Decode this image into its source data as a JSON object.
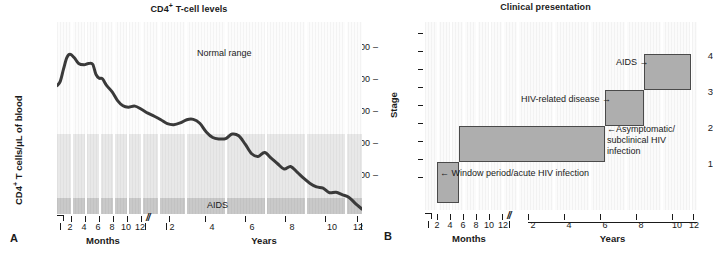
{
  "figure": {
    "panel_a_letter": "A",
    "panel_b_letter": "B"
  },
  "panelA": {
    "title": "CD4+ T-cell levels",
    "title_main": "CD4",
    "title_sup": "+",
    "title_rest": " T-cell levels",
    "ylabel_main": "CD4",
    "ylabel_sup": "+",
    "ylabel_rest": " T cells/μL of blood",
    "yticks": [
      "1000",
      "800",
      "600",
      "400",
      "200"
    ],
    "band_labels": {
      "normal": "Normal range",
      "aids": "AIDS"
    },
    "axis_months_name": "Months",
    "axis_years_name": "Years",
    "months_ticks": [
      "2",
      "4",
      "6",
      "8",
      "10",
      "12"
    ],
    "years_ticks": [
      "2",
      "4",
      "6",
      "8",
      "10",
      "12"
    ],
    "break_mark": "//"
  },
  "panelB": {
    "title": "Clinical presentation",
    "ylabel": "Stage",
    "yticks": [
      "4",
      "3",
      "2",
      "1"
    ],
    "axis_months_name": "Months",
    "axis_years_name": "Years",
    "months_ticks": [
      "2",
      "4",
      "6",
      "8",
      "10",
      "12"
    ],
    "years_ticks": [
      "2",
      "4",
      "6",
      "8",
      "10",
      "12"
    ],
    "break_mark": "//",
    "annotations": {
      "window_period": "← Window period/acute HIV infection",
      "hiv_related": "HIV-related disease →",
      "asymptomatic": "←Asymptomatic/ subclinical HIV infection",
      "aids": "AIDS →"
    }
  },
  "chart_data": [
    {
      "type": "line",
      "title": "CD4+ T-cell levels",
      "xlabel": "Months / Years",
      "ylabel": "CD4+ T cells/μL of blood",
      "ylim": [
        0,
        1100
      ],
      "yticks": [
        200,
        400,
        600,
        800,
        1000
      ],
      "grid": true,
      "x_axis_segments": [
        {
          "name": "Months",
          "ticks": [
            2,
            4,
            6,
            8,
            10,
            12
          ]
        },
        {
          "name": "Years",
          "ticks": [
            2,
            4,
            6,
            8,
            10,
            12
          ]
        }
      ],
      "bands": [
        {
          "label": "Normal range",
          "from": 600,
          "to": 1100,
          "color": "#fcfcfc"
        },
        {
          "label": "",
          "from": 200,
          "to": 600,
          "color": "#e8e8e8"
        },
        {
          "label": "AIDS",
          "from": 0,
          "to": 200,
          "color": "#c9c9c9"
        }
      ],
      "series": [
        {
          "name": "CD4+ T cells",
          "color": "#3a3a3a",
          "points": [
            [
              0.0,
              735
            ],
            [
              1.5,
              760
            ],
            [
              3.0,
              830
            ],
            [
              4.5,
              895
            ],
            [
              6.0,
              915
            ],
            [
              8.0,
              895
            ],
            [
              10.0,
              862
            ],
            [
              12.5,
              855
            ],
            [
              14.5,
              862
            ],
            [
              16.5,
              858
            ],
            [
              18.0,
              800
            ],
            [
              19.5,
              778
            ],
            [
              21.0,
              775
            ],
            [
              23.0,
              735
            ],
            [
              25.5,
              700
            ],
            [
              28.0,
              650
            ],
            [
              30.5,
              620
            ],
            [
              33.0,
              612
            ],
            [
              36.0,
              618
            ],
            [
              39.0,
              600
            ],
            [
              42.0,
              578
            ],
            [
              45.0,
              560
            ],
            [
              48.0,
              540
            ],
            [
              51.0,
              518
            ],
            [
              54.0,
              512
            ],
            [
              57.0,
              522
            ],
            [
              60.0,
              540
            ],
            [
              63.0,
              542
            ],
            [
              66.0,
              520
            ],
            [
              69.0,
              470
            ],
            [
              72.0,
              438
            ],
            [
              75.0,
              430
            ],
            [
              78.0,
              432
            ],
            [
              81.0,
              458
            ],
            [
              84.0,
              448
            ],
            [
              87.0,
              400
            ],
            [
              90.0,
              345
            ],
            [
              93.0,
              330
            ],
            [
              96.0,
              352
            ],
            [
              99.0,
              320
            ],
            [
              102.0,
              288
            ],
            [
              105.0,
              258
            ],
            [
              108.0,
              272
            ],
            [
              111.0,
              240
            ],
            [
              114.0,
              205
            ],
            [
              117.0,
              175
            ],
            [
              120.0,
              155
            ],
            [
              123.0,
              148
            ],
            [
              126.0,
              122
            ],
            [
              129.0,
              125
            ],
            [
              132.0,
              110
            ],
            [
              135.0,
              95
            ],
            [
              138.0,
              60
            ],
            [
              141.0,
              28
            ]
          ]
        }
      ]
    },
    {
      "type": "bar",
      "orientation": "horizontal-steps",
      "title": "Clinical presentation",
      "xlabel": "Months / Years",
      "ylabel": "Stage",
      "ylim": [
        0.5,
        4.7
      ],
      "yticks": [
        1,
        2,
        3,
        4
      ],
      "grid": true,
      "x_axis_segments": [
        {
          "name": "Months",
          "ticks": [
            2,
            4,
            6,
            8,
            10,
            12
          ]
        },
        {
          "name": "Years",
          "ticks": [
            2,
            4,
            6,
            8,
            10,
            12
          ]
        }
      ],
      "bars": [
        {
          "stage": 1,
          "label": "Window period/acute HIV infection",
          "x_start_pct": 4.5,
          "x_end_pct": 12.5,
          "y_bottom": 0.62,
          "y_top": 1.4
        },
        {
          "stage": 2,
          "label": "Asymptomatic/subclinical HIV infection",
          "x_start_pct": 12.5,
          "x_end_pct": 66.0,
          "y_bottom": 1.4,
          "y_top": 2.4
        },
        {
          "stage": 3,
          "label": "HIV-related disease",
          "x_start_pct": 66.0,
          "x_end_pct": 80.5,
          "y_bottom": 2.4,
          "y_top": 3.4
        },
        {
          "stage": 4,
          "label": "AIDS",
          "x_start_pct": 80.5,
          "x_end_pct": 98.0,
          "y_bottom": 3.4,
          "y_top": 4.4
        }
      ]
    }
  ]
}
